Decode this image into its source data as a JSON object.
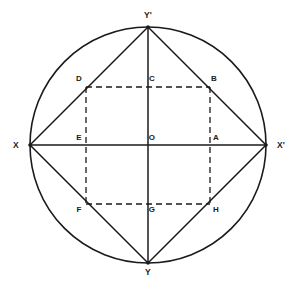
{
  "figure": {
    "background_color": "#ffffff",
    "stroke_color": "#1a1a1a",
    "canvas": {
      "width": 294,
      "height": 284
    }
  },
  "circle": {
    "name": "circumscribed-circle",
    "center": {
      "x": 148,
      "y": 145
    },
    "radius": 118,
    "stroke_width": 1.6,
    "style": "solid"
  },
  "axes": {
    "horizontal": {
      "name": "x-axis",
      "from": {
        "x": 30,
        "y": 145
      },
      "to": {
        "x": 266,
        "y": 145
      },
      "style": "solid",
      "stroke_width": 1.5
    },
    "vertical": {
      "name": "y-axis",
      "from": {
        "x": 148,
        "y": 27
      },
      "to": {
        "x": 148,
        "y": 263
      },
      "style": "solid",
      "stroke_width": 1.5
    }
  },
  "inscribed_square": {
    "name": "inscribed-square-XYpXpY",
    "style": "solid",
    "stroke_width": 1.5,
    "vertices": [
      {
        "label": "X",
        "x": 30,
        "y": 145
      },
      {
        "label": "Y'",
        "x": 148,
        "y": 27
      },
      {
        "label": "X'",
        "x": 266,
        "y": 145
      },
      {
        "label": "Y",
        "x": 148,
        "y": 263
      }
    ]
  },
  "inner_rectangle": {
    "name": "inner-dashed-rectangle-DBHF",
    "style": "dashed",
    "stroke_width": 1.3,
    "dash_pattern": "6,4",
    "vertices": [
      {
        "label": "D",
        "x": 86,
        "y": 87
      },
      {
        "label": "B",
        "x": 210,
        "y": 87
      },
      {
        "label": "H",
        "x": 210,
        "y": 204
      },
      {
        "label": "F",
        "x": 86,
        "y": 204
      }
    ]
  },
  "points": [
    {
      "id": "Yp",
      "label": "Y'",
      "x": 148,
      "y": 27,
      "label_x": 148,
      "label_y": 18,
      "anchor": "middle",
      "kind": "vertex-top",
      "interactable": false
    },
    {
      "id": "X",
      "label": "X",
      "x": 30,
      "y": 145,
      "label_x": 16,
      "label_y": 148,
      "anchor": "middle",
      "kind": "vertex-left",
      "interactable": false
    },
    {
      "id": "Xp",
      "label": "X'",
      "x": 266,
      "y": 145,
      "label_x": 281,
      "label_y": 148,
      "anchor": "middle",
      "kind": "vertex-right",
      "interactable": false
    },
    {
      "id": "Y",
      "label": "Y",
      "x": 148,
      "y": 263,
      "label_x": 148,
      "label_y": 275,
      "anchor": "middle",
      "kind": "vertex-bottom",
      "interactable": false
    },
    {
      "id": "D",
      "label": "D",
      "x": 86,
      "y": 87,
      "label_x": 79,
      "label_y": 81,
      "anchor": "middle",
      "kind": "rect-corner-tl",
      "interactable": false
    },
    {
      "id": "C",
      "label": "C",
      "x": 148,
      "y": 87,
      "label_x": 152,
      "label_y": 81,
      "anchor": "middle",
      "kind": "midpoint-top",
      "interactable": false
    },
    {
      "id": "B",
      "label": "B",
      "x": 210,
      "y": 87,
      "label_x": 214,
      "label_y": 81,
      "anchor": "middle",
      "kind": "rect-corner-tr",
      "interactable": false
    },
    {
      "id": "E",
      "label": "E",
      "x": 86,
      "y": 145,
      "label_x": 79,
      "label_y": 140,
      "anchor": "middle",
      "kind": "midpoint-left",
      "interactable": false
    },
    {
      "id": "O",
      "label": "O",
      "x": 148,
      "y": 145,
      "label_x": 152,
      "label_y": 140,
      "anchor": "middle",
      "kind": "center",
      "interactable": false
    },
    {
      "id": "A",
      "label": "A",
      "x": 210,
      "y": 145,
      "label_x": 216,
      "label_y": 140,
      "anchor": "middle",
      "kind": "midpoint-right",
      "interactable": false
    },
    {
      "id": "F",
      "label": "F",
      "x": 86,
      "y": 204,
      "label_x": 79,
      "label_y": 212,
      "anchor": "middle",
      "kind": "rect-corner-bl",
      "interactable": false
    },
    {
      "id": "G",
      "label": "G",
      "x": 148,
      "y": 204,
      "label_x": 152,
      "label_y": 212,
      "anchor": "middle",
      "kind": "midpoint-bottom",
      "interactable": false
    },
    {
      "id": "H",
      "label": "H",
      "x": 210,
      "y": 204,
      "label_x": 216,
      "label_y": 212,
      "anchor": "middle",
      "kind": "rect-corner-br",
      "interactable": false
    }
  ],
  "labels": {
    "Yp": "Y'",
    "X": "X",
    "Xp": "X'",
    "Y": "Y",
    "D": "D",
    "C": "C",
    "B": "B",
    "E": "E",
    "O": "O",
    "A": "A",
    "F": "F",
    "G": "G",
    "H": "H"
  },
  "colors": {
    "stroke": "#1a1a1a",
    "text": "#1a1a1a",
    "background": "#ffffff"
  }
}
